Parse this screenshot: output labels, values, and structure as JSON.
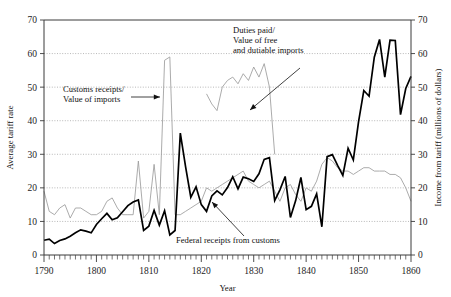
{
  "chart_data": {
    "type": "line",
    "title": "",
    "xlabel": "Year",
    "ylabel": "Average tariff rate",
    "y2label": "Income from tariff (millions of dollars)",
    "xlim": [
      1790,
      1860
    ],
    "ylim": [
      0,
      70
    ],
    "y2lim": [
      0,
      70
    ],
    "xticks": [
      1790,
      1800,
      1810,
      1820,
      1830,
      1840,
      1850,
      1860
    ],
    "xtick_labels": [
      "1790",
      "1800",
      "1810",
      "1820",
      "1830",
      "1840",
      "1850",
      "1860"
    ],
    "yticks": [
      0,
      10,
      20,
      30,
      40,
      50,
      60,
      70
    ],
    "ytick_labels": [
      "0",
      "10",
      "20",
      "30",
      "40",
      "50",
      "60",
      "70"
    ],
    "y2ticks": [
      0,
      10,
      20,
      30,
      40,
      50,
      60,
      70
    ],
    "y2tick_labels": [
      "0",
      "10",
      "20",
      "30",
      "40",
      "50",
      "60",
      "70"
    ],
    "minor_xtick_interval": 1,
    "grid": "horizontal-dotted",
    "legend": "none",
    "annotations": [
      {
        "id": "customs-receipts",
        "text_lines": [
          "Customs receipts/",
          "Value of imports"
        ],
        "text_x": 63,
        "text_y": 92,
        "arrow_from_x": 131,
        "arrow_from_y": 97,
        "arrow_to_x": 160,
        "arrow_to_y": 97
      },
      {
        "id": "duties-paid",
        "text_lines": [
          "Duties paid/",
          "Value of free",
          "and dutiable imports"
        ],
        "text_x": 233,
        "text_y": 33,
        "arrow_from_x": 300,
        "arrow_from_y": 68,
        "arrow_to_x": 250,
        "arrow_to_y": 110
      },
      {
        "id": "federal-receipts",
        "text_lines": [
          "Federal receipts from customs"
        ],
        "text_x": 176,
        "text_y": 243,
        "arrow_from_x": 244,
        "arrow_from_y": 236,
        "arrow_to_x": 212,
        "arrow_to_y": 202
      }
    ],
    "series": [
      {
        "name": "Customs receipts/Value of imports",
        "axis": "left",
        "style": "thin-gray",
        "color": "#9c9c9c",
        "x": [
          1790,
          1791,
          1792,
          1793,
          1794,
          1795,
          1796,
          1797,
          1798,
          1799,
          1800,
          1801,
          1802,
          1803,
          1804,
          1805,
          1806,
          1807,
          1808,
          1809,
          1810,
          1811,
          1812,
          1813,
          1814,
          1815,
          1816,
          1817,
          1818,
          1819,
          1820,
          1821,
          1822,
          1823,
          1824,
          1825,
          1826,
          1827,
          1828,
          1829,
          1830,
          1831,
          1832,
          1833,
          1834,
          1835,
          1836,
          1837,
          1838,
          1839,
          1840,
          1841,
          1842,
          1843,
          1844,
          1845,
          1846,
          1847,
          1848,
          1849,
          1850,
          1851,
          1852,
          1853,
          1854,
          1855,
          1856,
          1857,
          1858,
          1859,
          1860
        ],
        "values": [
          19,
          13,
          12,
          14,
          15,
          11,
          14,
          14,
          13,
          12,
          12,
          13,
          16,
          17,
          14,
          12,
          12,
          12,
          28,
          11,
          13,
          27,
          12,
          58,
          59,
          12,
          12,
          13,
          14,
          15,
          16,
          20,
          19,
          20,
          21,
          22,
          23,
          24,
          25,
          22,
          21,
          20,
          21,
          22,
          19,
          16,
          20,
          21,
          18,
          16,
          20,
          19,
          22,
          27,
          29,
          28,
          26,
          25,
          25,
          24,
          25,
          26,
          26,
          25,
          25,
          25,
          24,
          24,
          23,
          20,
          16
        ]
      },
      {
        "name": "Duties paid/Value of free and dutiable imports",
        "axis": "left",
        "style": "thin-gray",
        "color": "#9c9c9c",
        "x": [
          1821,
          1822,
          1823,
          1824,
          1825,
          1826,
          1827,
          1828,
          1829,
          1830,
          1831,
          1832,
          1833,
          1834
        ],
        "values": [
          48,
          45,
          43,
          50,
          52,
          53,
          51,
          54,
          52,
          56,
          53,
          57,
          50,
          30
        ]
      },
      {
        "name": "Federal receipts from customs",
        "axis": "right",
        "style": "bold-black",
        "color": "#000000",
        "x": [
          1790,
          1791,
          1792,
          1793,
          1794,
          1795,
          1796,
          1797,
          1798,
          1799,
          1800,
          1801,
          1802,
          1803,
          1804,
          1805,
          1806,
          1807,
          1808,
          1809,
          1810,
          1811,
          1812,
          1813,
          1814,
          1815,
          1816,
          1817,
          1818,
          1819,
          1820,
          1821,
          1822,
          1823,
          1824,
          1825,
          1826,
          1827,
          1828,
          1829,
          1830,
          1831,
          1832,
          1833,
          1834,
          1835,
          1836,
          1837,
          1838,
          1839,
          1840,
          1841,
          1842,
          1843,
          1844,
          1845,
          1846,
          1847,
          1848,
          1849,
          1850,
          1851,
          1852,
          1853,
          1854,
          1855,
          1856,
          1857,
          1858,
          1859,
          1860
        ],
        "values": [
          4.4,
          4.7,
          3.4,
          4.3,
          4.8,
          5.6,
          6.6,
          7.5,
          7.1,
          6.6,
          9.1,
          10.8,
          12.4,
          10.5,
          11.1,
          12.9,
          14.7,
          15.8,
          16.4,
          7.3,
          8.6,
          13.3,
          8.9,
          13.2,
          6.0,
          7.3,
          36.3,
          26.3,
          17.2,
          20.3,
          15.0,
          13.0,
          17.6,
          19.1,
          17.9,
          20.1,
          23.3,
          19.7,
          23.2,
          22.7,
          21.9,
          24.2,
          28.5,
          29.0,
          16.2,
          19.4,
          23.4,
          11.2,
          16.2,
          23.1,
          13.5,
          14.5,
          18.2,
          8.4,
          29.3,
          29.9,
          26.7,
          23.7,
          31.8,
          28.3,
          39.7,
          49.0,
          47.3,
          58.9,
          64.2,
          53.0,
          64.0,
          63.9,
          41.8,
          49.6,
          53.2
        ]
      }
    ]
  }
}
